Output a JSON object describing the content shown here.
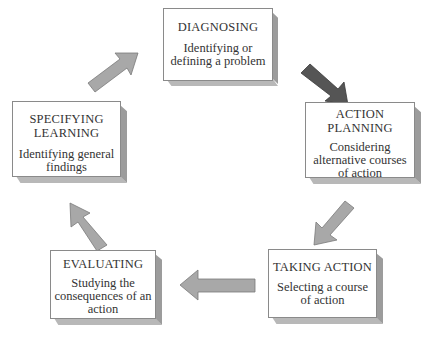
{
  "diagram": {
    "type": "cycle",
    "nodes": [
      {
        "id": "diagnosing",
        "title": "DIAGNOSING",
        "title_lines": [
          "DIAGNOSING"
        ],
        "desc_lines": [
          "Identifying or",
          "defining a problem"
        ]
      },
      {
        "id": "action_planning",
        "title": "ACTION PLANNING",
        "title_lines": [
          "ACTION",
          "PLANNING"
        ],
        "desc_lines": [
          "Considering",
          "alternative courses",
          "of action"
        ]
      },
      {
        "id": "taking_action",
        "title": "TAKING ACTION",
        "title_lines": [
          "TAKING ACTION"
        ],
        "desc_lines": [
          "Selecting a course",
          "of action"
        ]
      },
      {
        "id": "evaluating",
        "title": "EVALUATING",
        "title_lines": [
          "EVALUATING"
        ],
        "desc_lines": [
          "Studying the",
          "consequences of an",
          "action"
        ]
      },
      {
        "id": "specifying_learning",
        "title": "SPECIFYING LEARNING",
        "title_lines": [
          "SPECIFYING",
          "LEARNING"
        ],
        "desc_lines": [
          "Identifying general",
          "findings"
        ]
      }
    ],
    "edges": [
      {
        "from": "diagnosing",
        "to": "action_planning",
        "color": "#555555"
      },
      {
        "from": "action_planning",
        "to": "taking_action",
        "color": "#a8a8a8"
      },
      {
        "from": "taking_action",
        "to": "evaluating",
        "color": "#a8a8a8"
      },
      {
        "from": "evaluating",
        "to": "specifying_learning",
        "color": "#a8a8a8"
      },
      {
        "from": "specifying_learning",
        "to": "diagnosing",
        "color": "#a8a8a8"
      }
    ]
  }
}
